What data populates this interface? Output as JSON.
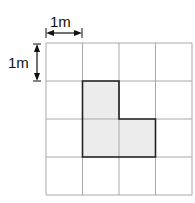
{
  "diagram": {
    "type": "grid-area-figure",
    "grid": {
      "rows": 4,
      "cols": 4,
      "line_color": "#a8a8a8"
    },
    "scale": {
      "horizontal_label": "1m",
      "vertical_label": "1m"
    },
    "shape": {
      "name": "L-shape",
      "cells": [
        [
          1,
          1
        ],
        [
          1,
          2
        ],
        [
          2,
          2
        ]
      ],
      "fill": "#ececec",
      "stroke": "#222222",
      "area_units": 3
    }
  }
}
